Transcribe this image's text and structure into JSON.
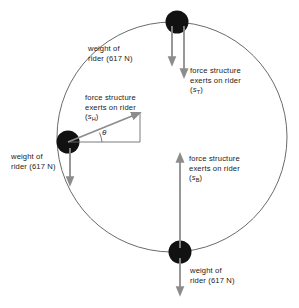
{
  "diagram": {
    "type": "free-body-diagram",
    "colors": {
      "circle_stroke": "#6b6b6b",
      "dot_fill": "#111111",
      "arrow_gray": "#8c8c8c",
      "triangle_line": "#6b6b6b",
      "text": "#1a1a1a",
      "background": "#ffffff"
    },
    "circle": {
      "cx": 172,
      "cy": 137,
      "r": 115
    },
    "positions": [
      {
        "name": "top",
        "x": 177,
        "y": 22
      },
      {
        "name": "left",
        "x": 68,
        "y": 142
      },
      {
        "name": "bottom",
        "x": 180,
        "y": 252
      }
    ]
  },
  "labels": {
    "weight_top": {
      "line1": "weight of",
      "line2": "rider (617 N)"
    },
    "force_top": {
      "line1": "force structure",
      "line2": "exerts on rider",
      "symbol": "s",
      "subscript": "T"
    },
    "force_left": {
      "line1": "force structure",
      "line2": "exerts on rider",
      "symbol": "s",
      "subscript": "H"
    },
    "weight_left": {
      "line1": "weight of",
      "line2": "rider (617 N)"
    },
    "force_bottom": {
      "line1": "force structure",
      "line2": "exerts on rider",
      "symbol": "s",
      "subscript": "B"
    },
    "weight_bottom": {
      "line1": "weight of",
      "line2": "rider (617 N)"
    },
    "angle": "θ"
  }
}
